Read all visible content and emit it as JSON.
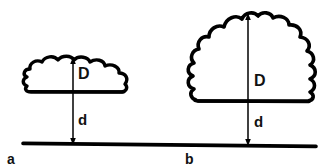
{
  "figure": {
    "background_color": "#ffffff",
    "ink_color": "#000000",
    "width": 332,
    "height": 168
  },
  "ground": {
    "name": "ground-line",
    "label": ""
  },
  "panels": [
    {
      "id": "a",
      "letter": "a",
      "cloud_type": "shallow-cumulus",
      "depth_label": "D",
      "base_height_label": "d",
      "cloud": {
        "left": 24,
        "right": 132,
        "top": 57,
        "base": 92,
        "depth_px": 35,
        "width_px": 108,
        "lobes_top": 5
      },
      "arrow": {
        "x": 73,
        "top_y": 58,
        "base_y": 92,
        "ground_y": 144
      }
    },
    {
      "id": "b",
      "letter": "b",
      "cloud_type": "deep-cumulus",
      "depth_label": "D",
      "base_height_label": "d",
      "cloud": {
        "left": 192,
        "right": 318,
        "top": 13,
        "base": 102,
        "depth_px": 89,
        "width_px": 126,
        "lobes_top": 5
      },
      "arrow": {
        "x": 248,
        "top_y": 14,
        "base_y": 102,
        "ground_y": 146
      }
    }
  ],
  "annotations": {
    "a_D": "D",
    "a_d": "d",
    "b_D": "D",
    "b_d": "d",
    "a_letter": "a",
    "b_letter": "b"
  }
}
